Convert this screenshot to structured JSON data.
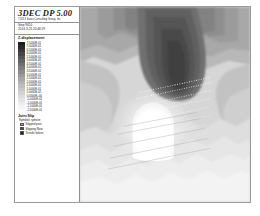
{
  "window": {
    "background": "#ffffff",
    "frame_border": "#9a9a9a"
  },
  "legend": {
    "app_title": "3DEC  DP 5.00",
    "copyright_line": "©2013 Itasca Consulting Group, Inc.",
    "step_label": "Step  9410",
    "date_label": "2014-3-25 20:46:19",
    "contour_title": "Z-displacement",
    "colorbar": {
      "orientation": "vertical",
      "colors_top_to_bottom": [
        "#1c1c1c",
        "#2a2a2a",
        "#383838",
        "#464646",
        "#545454",
        "#626262",
        "#707070",
        "#7e7e7e",
        "#8c8c8c",
        "#9a9a9a",
        "#a6a6a6",
        "#b2b2b2",
        "#bebebe",
        "#c8c8c8",
        "#d2d2d2",
        "#dcdcdc",
        "#e4e4e4",
        "#ececec",
        "#f4f4f4",
        "#fbfbfb"
      ],
      "labels": [
        "7.5000E-01",
        "7.0000E-01",
        "6.5000E-01",
        "6.0000E-01",
        "5.5000E-01",
        "5.0000E-01",
        "4.5000E-01",
        "4.0000E-01",
        "3.5000E-01",
        "3.0000E-01",
        "2.5000E-01",
        "2.0000E-01",
        "1.5000E-01",
        "1.0000E-01",
        "5.0000E-02",
        "0.0000E+00",
        "-5.0000E-02",
        "-1.0000E-01",
        "-1.5000E-01",
        "-2.0000E-01"
      ]
    },
    "joint_slip": {
      "title": "Joint Slip",
      "subtitle": "Symbol: sphere",
      "items": [
        {
          "label": "Slipped past",
          "color": "#9e9e9e"
        },
        {
          "label": "Slipping Now",
          "color": "#4a4a4a"
        },
        {
          "label": "Tensile failure",
          "color": "#1e1e1e"
        }
      ]
    }
  },
  "plot": {
    "type": "contour-fill",
    "palette": "grayscale",
    "excavation_label": "excavation-dome",
    "excavation_color": "#ffffff",
    "background_color": "#d8d8d8",
    "joint_marker_color": "#ffffff"
  },
  "chart_data": {
    "type": "heatmap",
    "title": "Z-displacement",
    "xlabel": "",
    "ylabel": "",
    "legend_position": "left",
    "grid": false,
    "colorbar_min": -0.2,
    "colorbar_max": 0.75,
    "colorbar_step": 0.05,
    "units": "m",
    "bands": 20,
    "tick_labels": [
      "7.5000E-01",
      "7.0000E-01",
      "6.5000E-01",
      "6.0000E-01",
      "5.5000E-01",
      "5.0000E-01",
      "4.5000E-01",
      "4.0000E-01",
      "3.5000E-01",
      "3.0000E-01",
      "2.5000E-01",
      "2.0000E-01",
      "1.5000E-01",
      "1.0000E-01",
      "5.0000E-02",
      "0.0000E+00",
      "-5.0000E-02",
      "-1.0000E-01",
      "-1.5000E-01",
      "-2.0000E-01"
    ],
    "annotations": [
      "Step  9410",
      "2014-3-25 20:46:19"
    ]
  }
}
